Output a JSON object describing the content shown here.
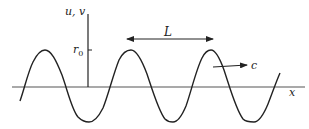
{
  "diagram": {
    "axes": {
      "y_label": "u, v",
      "x_label": "x",
      "y_tick_label": "r",
      "y_tick_subscript": "0"
    },
    "annotations": {
      "wavelength_label": "L",
      "speed_label": "c"
    },
    "colors": {
      "stroke": "#222222",
      "background": "#ffffff"
    }
  }
}
